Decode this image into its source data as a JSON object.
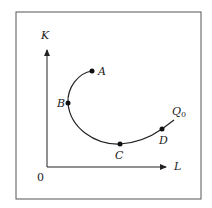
{
  "diagram": {
    "axes": {
      "y_label": "K",
      "x_label": "L",
      "origin_label": "0"
    },
    "curve_label": "Q",
    "curve_label_sub": "0",
    "points": [
      {
        "label": "A"
      },
      {
        "label": "B"
      },
      {
        "label": "C"
      },
      {
        "label": "D"
      }
    ],
    "colors": {
      "line": "#222222",
      "frame": "#555555",
      "background": "#ffffff"
    }
  }
}
